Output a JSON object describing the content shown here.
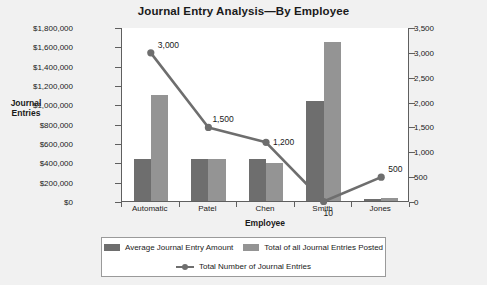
{
  "chart_data": {
    "type": "bar",
    "title": "Journal Entry Analysis—By Employee",
    "xlabel": "Employee",
    "ylabel": "Journal Entries",
    "categories": [
      "Automatic",
      "Patel",
      "Chen",
      "Smith",
      "Jones"
    ],
    "grid": false,
    "legend_position": "bottom",
    "ylim": [
      0,
      1800000
    ],
    "y2lim": [
      0,
      3500
    ],
    "yticks": [
      "$0",
      "$200,000",
      "$400,000",
      "$600,000",
      "$800,000",
      "$1,000,000",
      "$1,200,000",
      "$1,400,000",
      "$1,600,000",
      "$1,800,000"
    ],
    "ytick_values": [
      0,
      200000,
      400000,
      600000,
      800000,
      1000000,
      1200000,
      1400000,
      1600000,
      1800000
    ],
    "y2ticks": [
      "0",
      "500",
      "1,000",
      "1,500",
      "2,000",
      "2,500",
      "3,000",
      "3,500"
    ],
    "y2tick_values": [
      0,
      500,
      1000,
      1500,
      2000,
      2500,
      3000,
      3500
    ],
    "series": [
      {
        "name": "Average Journal Entry Amount",
        "kind": "bar",
        "axis": "left",
        "color": "#6e6e6e",
        "values": [
          430000,
          430000,
          430000,
          1030000,
          20000
        ]
      },
      {
        "name": "Total of all Journal Entries Posted",
        "kind": "bar",
        "axis": "left",
        "color": "#949494",
        "values": [
          1100000,
          430000,
          390000,
          1650000,
          30000
        ]
      },
      {
        "name": "Total Number of Journal Entries",
        "kind": "line",
        "axis": "right",
        "color": "#6e6e6e",
        "values": [
          3000,
          1500,
          1200,
          10,
          500
        ],
        "point_labels": [
          "3,000",
          "1,500",
          "1,200",
          "10",
          "500"
        ]
      }
    ]
  },
  "legend": {
    "items": [
      {
        "label": "Average Journal Entry Amount"
      },
      {
        "label": "Total of all Journal Entries Posted"
      },
      {
        "label": "Total Number of Journal Entries"
      }
    ]
  }
}
